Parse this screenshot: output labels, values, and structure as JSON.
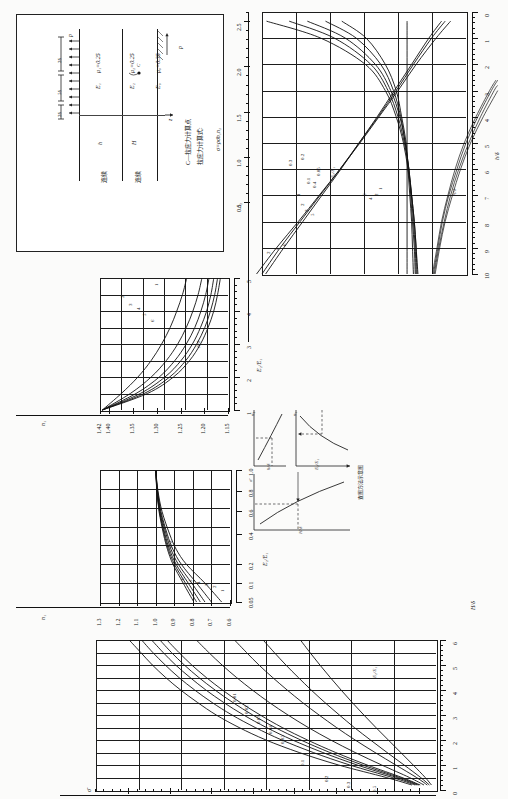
{
  "figure": {
    "orientation": "rotated-90-ccw",
    "caption_note": "",
    "schematic": {
      "title_lines": [
        "C—拉应力计算点",
        "拉应力计算式:"
      ],
      "formula": "σ=ρσ̄n₁n₂",
      "load_label": "p",
      "load_label_bottom": "p",
      "dim_labels": [
        "2δ",
        "5δ",
        "2δ"
      ],
      "layer_labels": [
        {
          "modulus": "E₁",
          "poisson": "μ₁=0.25",
          "thickness": "h",
          "edge": "连续"
        },
        {
          "modulus": "E₂",
          "poisson": "μ₂=0.25",
          "thickness": "H",
          "edge": "连续"
        },
        {
          "modulus": "E₀",
          "poisson": "μ₀=0.35",
          "thickness": "",
          "edge": ""
        }
      ],
      "point_label": "C",
      "axis_label": "z"
    },
    "method_diagram": {
      "name": "图方法示意图",
      "title": "查图方法示意图",
      "sub_axes": [
        {
          "ylabel": "n₁",
          "xlabel": "E₂/E₁"
        },
        {
          "ylabel": "n₂",
          "xlabel": "h/δ"
        },
        {
          "ylabel": "σ̄",
          "xlabel": "H/δ"
        },
        {
          "ylabel": "E₂/E₁",
          "xlabel": ""
        }
      ]
    }
  },
  "chart_data": [
    {
      "id": "chart-n2",
      "type": "line",
      "title": "",
      "xlabel": "h/δ",
      "ylabel": "n₂",
      "xlim": [
        0,
        10
      ],
      "ylim": [
        0.35,
        2.6
      ],
      "xticks": [
        0,
        1,
        2,
        3,
        4,
        5,
        6,
        7,
        8,
        9,
        10
      ],
      "yticks": [
        0.5,
        1.0,
        1.5,
        2.0,
        2.5
      ],
      "grid": true,
      "legend_upper": "E₂/E₁",
      "legend_lower": "H/δ",
      "series": [
        {
          "name": "0.05",
          "group": "E2/E1",
          "x": [
            0.35,
            1,
            2,
            3,
            4,
            5,
            6,
            7,
            8,
            9,
            10
          ],
          "values": [
            2.55,
            1.95,
            1.46,
            1.24,
            1.12,
            1.04,
            0.99,
            0.95,
            0.92,
            0.9,
            0.88
          ]
        },
        {
          "name": "0.1",
          "group": "E2/E1",
          "x": [
            0.35,
            1,
            2,
            3,
            4,
            5,
            6,
            7,
            8,
            9,
            10
          ],
          "values": [
            2.3,
            1.8,
            1.4,
            1.21,
            1.1,
            1.03,
            0.98,
            0.95,
            0.92,
            0.9,
            0.89
          ]
        },
        {
          "name": "0.2",
          "group": "E2/E1",
          "x": [
            0.35,
            1,
            2,
            3,
            4,
            5,
            6,
            7,
            8,
            9,
            10
          ],
          "values": [
            2.1,
            1.68,
            1.35,
            1.18,
            1.08,
            1.02,
            0.98,
            0.95,
            0.93,
            0.91,
            0.9
          ]
        },
        {
          "name": "0.3",
          "group": "E2/E1",
          "x": [
            0.35,
            1,
            2,
            3,
            4,
            5,
            6,
            7,
            8,
            9,
            10
          ],
          "values": [
            1.9,
            1.56,
            1.29,
            1.15,
            1.07,
            1.02,
            0.98,
            0.96,
            0.94,
            0.92,
            0.91
          ]
        },
        {
          "name": "0.4",
          "group": "E2/E1",
          "x": [
            0.35,
            1,
            2,
            3,
            4,
            5,
            6,
            7,
            8,
            9,
            10
          ],
          "values": [
            1.72,
            1.45,
            1.24,
            1.12,
            1.06,
            1.01,
            0.99,
            0.97,
            0.95,
            0.94,
            0.93
          ]
        },
        {
          "name": "1",
          "group": "E2/E1",
          "x": [
            0.35,
            1,
            2,
            3,
            4,
            5,
            6,
            7,
            8,
            9,
            10
          ],
          "values": [
            1.0,
            1.0,
            1.0,
            1.0,
            1.0,
            1.0,
            1.0,
            1.0,
            1.0,
            1.0,
            1.0
          ]
        },
        {
          "name": "2",
          "group": "H/delta",
          "x": [
            0.35,
            1,
            2,
            3,
            4,
            5,
            6,
            7,
            8,
            9,
            10
          ],
          "values": [
            0.62,
            0.76,
            0.95,
            1.14,
            1.33,
            1.53,
            1.73,
            1.94,
            2.15,
            2.36,
            2.56
          ]
        },
        {
          "name": "3",
          "group": "H/delta",
          "x": [
            0.35,
            1,
            2,
            3,
            4,
            5,
            6,
            7,
            8,
            9,
            10
          ],
          "values": [
            0.58,
            0.73,
            0.93,
            1.12,
            1.32,
            1.53,
            1.74,
            1.96,
            2.18,
            2.4,
            2.6
          ]
        },
        {
          "name": "5",
          "group": "H/delta",
          "x": [
            0.35,
            1,
            2,
            3,
            4,
            5,
            6,
            7,
            8,
            9,
            10
          ],
          "values": [
            0.52,
            0.68,
            0.9,
            1.1,
            1.31,
            1.52,
            1.74,
            1.97,
            2.2,
            2.44,
            2.66
          ]
        }
      ],
      "lower_curves": [
        {
          "name": "1",
          "x": [
            2.6,
            3,
            4,
            5,
            6,
            7,
            8,
            9,
            10
          ],
          "values": [
            0.02,
            0.09,
            0.24,
            0.37,
            0.47,
            0.55,
            0.62,
            0.67,
            0.72
          ]
        },
        {
          "name": "2",
          "x": [
            2.6,
            3,
            4,
            5,
            6,
            7,
            8,
            9,
            10
          ],
          "values": [
            0.0,
            0.07,
            0.22,
            0.35,
            0.45,
            0.54,
            0.61,
            0.66,
            0.71
          ]
        },
        {
          "name": "4",
          "x": [
            2.8,
            3,
            4,
            5,
            6,
            7,
            8,
            9,
            10
          ],
          "values": [
            0.0,
            0.04,
            0.19,
            0.32,
            0.43,
            0.52,
            0.59,
            0.65,
            0.7
          ]
        },
        {
          "name": "6",
          "x": [
            3.0,
            4,
            5,
            6,
            7,
            8,
            9,
            10
          ],
          "values": [
            0.0,
            0.16,
            0.3,
            0.41,
            0.5,
            0.58,
            0.64,
            0.69
          ]
        }
      ]
    },
    {
      "id": "chart-n1-vs-E2E1-upper",
      "type": "line",
      "xlabel": "E₂/E₁",
      "ylabel": "n₁",
      "xlim": [
        1,
        5
      ],
      "ylim": [
        1.15,
        1.42
      ],
      "xticks": [
        1,
        2,
        3,
        4,
        5
      ],
      "yticks": [
        1.42,
        1.4,
        1.35,
        1.3,
        1.25,
        1.2,
        1.15
      ],
      "ytick_labels": [
        "1.42",
        "1.40",
        "1.35",
        "1.30",
        "1.25",
        "1.20",
        "1.15"
      ],
      "grid": true,
      "legend": "H/δ",
      "series": [
        {
          "name": "1",
          "x": [
            1,
            1.5,
            2,
            2.5,
            3,
            3.5,
            4,
            4.5,
            5
          ],
          "values": [
            1.415,
            1.375,
            1.34,
            1.312,
            1.29,
            1.272,
            1.258,
            1.246,
            1.237
          ]
        },
        {
          "name": "2",
          "x": [
            1,
            1.5,
            2,
            2.5,
            3,
            3.5,
            4,
            4.5,
            5
          ],
          "values": [
            1.415,
            1.356,
            1.312,
            1.28,
            1.256,
            1.238,
            1.224,
            1.213,
            1.205
          ]
        },
        {
          "name": "3",
          "x": [
            1,
            1.5,
            2,
            2.5,
            3,
            3.5,
            4,
            4.5,
            5
          ],
          "values": [
            1.415,
            1.344,
            1.295,
            1.262,
            1.238,
            1.22,
            1.207,
            1.197,
            1.19
          ]
        },
        {
          "name": "4",
          "x": [
            1,
            1.5,
            2,
            2.5,
            3,
            3.5,
            4,
            4.5,
            5
          ],
          "values": [
            1.415,
            1.335,
            1.283,
            1.249,
            1.225,
            1.208,
            1.195,
            1.186,
            1.18
          ]
        },
        {
          "name": "5",
          "x": [
            1,
            1.5,
            2,
            2.5,
            3,
            3.5,
            4,
            4.5,
            5
          ],
          "values": [
            1.415,
            1.327,
            1.273,
            1.239,
            1.216,
            1.199,
            1.187,
            1.178,
            1.172
          ]
        },
        {
          "name": "6",
          "x": [
            1,
            1.5,
            2,
            2.5,
            3,
            3.5,
            4,
            4.5,
            5
          ],
          "values": [
            1.415,
            1.32,
            1.265,
            1.231,
            1.208,
            1.192,
            1.18,
            1.172,
            1.166
          ]
        }
      ]
    },
    {
      "id": "chart-n1-vs-E2E1-lower",
      "type": "line",
      "xlabel": "E₂/E₁",
      "ylabel": "n₁",
      "xlim": [
        0.05,
        1.0
      ],
      "ylim": [
        0.6,
        1.3
      ],
      "xticks": [
        0.05,
        0.1,
        0.2,
        0.4,
        0.6,
        0.8,
        1.0
      ],
      "xtick_labels": [
        "0.05",
        "0.1",
        "0.2",
        "0.4",
        "0.6",
        "0.8",
        "1.0"
      ],
      "yticks": [
        0.6,
        0.7,
        0.8,
        0.9,
        1.0,
        1.1,
        1.2,
        1.3
      ],
      "ytick_labels": [
        "0.6",
        "0.7",
        "0.8",
        "0.9",
        "1.0",
        "1.1",
        "1.2",
        "1.3"
      ],
      "grid": true,
      "legend": "H/δ",
      "series": [
        {
          "name": "1",
          "x": [
            0.05,
            0.1,
            0.2,
            0.3,
            0.4,
            0.6,
            0.8,
            1.0
          ],
          "values": [
            0.645,
            0.735,
            0.835,
            0.89,
            0.925,
            0.966,
            0.988,
            1.0
          ]
        },
        {
          "name": "2",
          "x": [
            0.05,
            0.1,
            0.2,
            0.3,
            0.4,
            0.6,
            0.8,
            1.0
          ],
          "values": [
            0.7,
            0.78,
            0.862,
            0.908,
            0.938,
            0.972,
            0.99,
            1.0
          ]
        },
        {
          "name": "3",
          "x": [
            0.05,
            0.1,
            0.2,
            0.3,
            0.4,
            0.6,
            0.8,
            1.0
          ],
          "values": [
            0.735,
            0.806,
            0.878,
            0.918,
            0.944,
            0.975,
            0.991,
            1.0
          ]
        },
        {
          "name": "4",
          "x": [
            0.05,
            0.1,
            0.2,
            0.3,
            0.4,
            0.6,
            0.8,
            1.0
          ],
          "values": [
            0.76,
            0.825,
            0.89,
            0.926,
            0.95,
            0.978,
            0.992,
            1.0
          ]
        },
        {
          "name": "5",
          "x": [
            0.05,
            0.1,
            0.2,
            0.3,
            0.4,
            0.6,
            0.8,
            1.0
          ],
          "values": [
            0.78,
            0.84,
            0.899,
            0.932,
            0.954,
            0.98,
            0.993,
            1.0
          ]
        },
        {
          "name": "6",
          "x": [
            0.05,
            0.1,
            0.2,
            0.3,
            0.4,
            0.6,
            0.8,
            1.0
          ],
          "values": [
            0.795,
            0.852,
            0.907,
            0.937,
            0.958,
            0.982,
            0.994,
            1.0
          ]
        }
      ]
    },
    {
      "id": "chart-sigma-bar",
      "type": "line",
      "xlabel": "H/δ",
      "ylabel": "σ̄",
      "xlim": [
        0,
        6
      ],
      "ylim": [
        0.0,
        0.82
      ],
      "xticks": [
        0,
        1,
        2,
        3,
        4,
        5,
        6
      ],
      "yticks": [
        0.1,
        0.2,
        0.3,
        0.4,
        0.5,
        0.6,
        0.7,
        0.8
      ],
      "ytick_labels": [
        "0.1",
        "0.2",
        "0.3",
        "0.4",
        "0.5",
        "0.6",
        "0.7",
        "0.8"
      ],
      "grid": true,
      "legend": "E₂/E₁",
      "series": [
        {
          "name": "0.01",
          "x": [
            0.2,
            0.5,
            1,
            1.5,
            2,
            2.5,
            3,
            3.5,
            4,
            4.5,
            5,
            5.5,
            6
          ],
          "values": [
            0.058,
            0.12,
            0.235,
            0.33,
            0.41,
            0.475,
            0.53,
            0.575,
            0.616,
            0.652,
            0.684,
            0.712,
            0.74
          ]
        },
        {
          "name": "0.02",
          "x": [
            0.2,
            0.5,
            1,
            1.5,
            2,
            2.5,
            3,
            3.5,
            4,
            4.5,
            5,
            5.5,
            6
          ],
          "values": [
            0.05,
            0.105,
            0.208,
            0.296,
            0.372,
            0.436,
            0.492,
            0.54,
            0.582,
            0.62,
            0.653,
            0.683,
            0.71
          ]
        },
        {
          "name": "0.03",
          "x": [
            0.2,
            0.5,
            1,
            1.5,
            2,
            2.5,
            3,
            3.5,
            4,
            4.5,
            5,
            5.5,
            6
          ],
          "values": [
            0.045,
            0.095,
            0.19,
            0.273,
            0.346,
            0.409,
            0.464,
            0.512,
            0.555,
            0.593,
            0.628,
            0.658,
            0.686
          ]
        },
        {
          "name": "0.04",
          "x": [
            0.2,
            0.5,
            1,
            1.5,
            2,
            2.5,
            3,
            3.5,
            4,
            4.5,
            5,
            5.5,
            6
          ],
          "values": [
            0.041,
            0.088,
            0.177,
            0.256,
            0.326,
            0.388,
            0.442,
            0.49,
            0.533,
            0.572,
            0.607,
            0.638,
            0.666
          ]
        },
        {
          "name": "0.05",
          "x": [
            0.2,
            0.5,
            1,
            1.5,
            2,
            2.5,
            3,
            3.5,
            4,
            4.5,
            5,
            5.5,
            6
          ],
          "values": [
            0.038,
            0.082,
            0.166,
            0.242,
            0.31,
            0.371,
            0.424,
            0.472,
            0.515,
            0.554,
            0.589,
            0.62,
            0.649
          ]
        },
        {
          "name": "0.1",
          "x": [
            0.2,
            0.5,
            1,
            1.5,
            2,
            2.5,
            3,
            3.5,
            4,
            4.5,
            5,
            5.5,
            6
          ],
          "values": [
            0.029,
            0.064,
            0.131,
            0.195,
            0.254,
            0.308,
            0.357,
            0.402,
            0.443,
            0.481,
            0.516,
            0.548,
            0.578
          ]
        },
        {
          "name": "0.2",
          "x": [
            0.2,
            0.5,
            1,
            1.5,
            2,
            2.5,
            3,
            3.5,
            4,
            4.5,
            5,
            5.5,
            6
          ],
          "values": [
            0.021,
            0.047,
            0.097,
            0.147,
            0.195,
            0.24,
            0.282,
            0.322,
            0.359,
            0.394,
            0.427,
            0.457,
            0.486
          ]
        },
        {
          "name": "0.3",
          "x": [
            0.2,
            0.5,
            1,
            1.5,
            2,
            2.5,
            3,
            3.5,
            4,
            4.5,
            5,
            5.5,
            6
          ],
          "values": [
            0.016,
            0.037,
            0.077,
            0.118,
            0.158,
            0.197,
            0.233,
            0.268,
            0.301,
            0.332,
            0.362,
            0.39,
            0.417
          ]
        },
        {
          "name": "0.5",
          "x": [
            0.2,
            0.5,
            1,
            1.5,
            2,
            2.5,
            3,
            3.5,
            4,
            4.5,
            5,
            5.5,
            6
          ],
          "values": [
            0.011,
            0.026,
            0.055,
            0.085,
            0.115,
            0.145,
            0.174,
            0.202,
            0.229,
            0.255,
            0.28,
            0.304,
            0.327
          ]
        }
      ]
    }
  ]
}
